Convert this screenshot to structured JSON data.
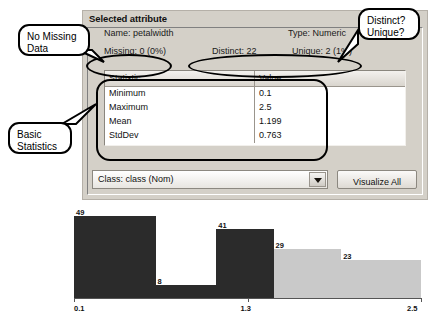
{
  "panel": {
    "title": "Selected attribute",
    "name_label": "Name:",
    "name_value": "petalwidth",
    "type_label": "Type:",
    "type_value": "Numeric",
    "missing_label": "Missing:",
    "missing_value": "0 (0%)",
    "distinct_label": "Distinct:",
    "distinct_value": "22",
    "unique_label": "Unique:",
    "unique_value": "2 (1%)"
  },
  "stats": {
    "headers": [
      "Statistic",
      "Value"
    ],
    "rows": [
      [
        "Minimum",
        "0.1"
      ],
      [
        "Maximum",
        "2.5"
      ],
      [
        "Mean",
        "1.199"
      ],
      [
        "StdDev",
        "0.763"
      ]
    ]
  },
  "controls": {
    "class_selected": "Class: class (Nom)",
    "dropdown_icon": "chevron-down-icon",
    "visualize_label": "Visualize All"
  },
  "annotations": [
    {
      "id": "missing",
      "line1": "No Missing",
      "line2": "Data"
    },
    {
      "id": "stats",
      "line1": "Basic",
      "line2": "Statistics"
    },
    {
      "id": "distinct",
      "line1": "Distinct?",
      "line2": "Unique?"
    }
  ],
  "chart_data": {
    "type": "bar",
    "title": "",
    "xlabel": "",
    "ylabel": "",
    "categories": [
      "0.1",
      "0.5",
      "1.3",
      "1.8",
      "2.5"
    ],
    "values": [
      49,
      8,
      41,
      29,
      23
    ],
    "bar_colors": [
      "#2b2b2b",
      "#2b2b2b",
      "#2b2b2b",
      "#c9c9c9",
      "#c9c9c9"
    ],
    "xticks": [
      "0.1",
      "1.3",
      "2.5"
    ],
    "ylim": [
      0,
      49
    ],
    "grid": false,
    "legend": false
  }
}
